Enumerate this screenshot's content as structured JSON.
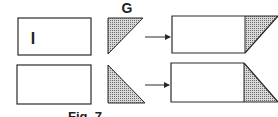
{
  "figure": {
    "caption": "Fig. 7",
    "top_label": "G",
    "box_label": "I"
  },
  "colors": {
    "stroke": "#2a2a2a",
    "hatch_fill": "#bdbdbd",
    "background": "#ffffff"
  }
}
